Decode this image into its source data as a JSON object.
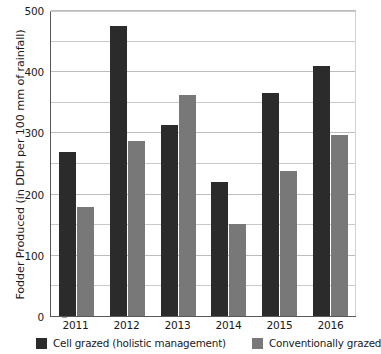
{
  "chart_data": {
    "type": "bar",
    "title": "",
    "subtitle": "",
    "xlabel": "",
    "ylabel": "Fodder Produced (in DDH per 100 mm of rainfall)",
    "categories": [
      "2011",
      "2012",
      "2013",
      "2014",
      "2015",
      "2016"
    ],
    "series": [
      {
        "name": "Cell grazed (holistic management)",
        "color": "#2b2b2b",
        "values": [
          270,
          475,
          313,
          220,
          366,
          410
        ]
      },
      {
        "name": "Conventionally grazed",
        "color": "#787878",
        "values": [
          180,
          288,
          362,
          152,
          238,
          297
        ]
      }
    ],
    "ylim": [
      0,
      500
    ],
    "y_ticks": [
      0,
      100,
      200,
      300,
      400,
      500
    ],
    "y_tick_labels": [
      "0",
      "100",
      "200",
      "300",
      "400",
      "500"
    ],
    "y_gridline_values": [
      50,
      100,
      150,
      200,
      250,
      300,
      350,
      400,
      450,
      500
    ],
    "grid": true,
    "grid_axis": "y",
    "legend_position": "bottom",
    "bar_orientation": "vertical",
    "background_color": "#ffffff",
    "gridline_color": "#c9c9c9",
    "axis_color": "#58585a"
  }
}
